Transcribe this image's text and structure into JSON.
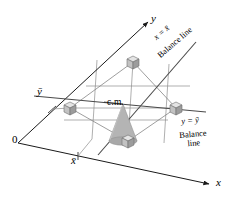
{
  "figure": {
    "colors": {
      "stroke": "#3a3a3a",
      "axis": "#1a1a1a",
      "cone_fill": "#b0b0b0",
      "cone_stroke": "#8a8a8a",
      "cube_light": "#e2e2e2",
      "cube_mid": "#c6c6c6",
      "cube_dark": "#9e9e9e",
      "background": "#ffffff"
    },
    "axes": {
      "y_label": "y",
      "x_label": "x",
      "origin_label": "0",
      "ybar_tick_label": "ȳ",
      "xbar_tick_label": "x̄"
    },
    "annotations": {
      "cm_label": "c.m.",
      "balance_line_x": {
        "equation": "x = x̄",
        "caption": "Balance line"
      },
      "balance_line_y": {
        "equation": "y = ȳ",
        "caption_line1": "Balance",
        "caption_line2": "line"
      }
    },
    "masses": [
      {
        "name": "mass-top",
        "cx": 133,
        "cy": 62
      },
      {
        "name": "mass-left",
        "cx": 70,
        "cy": 108
      },
      {
        "name": "mass-right",
        "cx": 176,
        "cy": 108
      },
      {
        "name": "mass-bottom",
        "cx": 128,
        "cy": 141
      }
    ],
    "center_of_mass": {
      "x": 123,
      "y": 104
    }
  }
}
